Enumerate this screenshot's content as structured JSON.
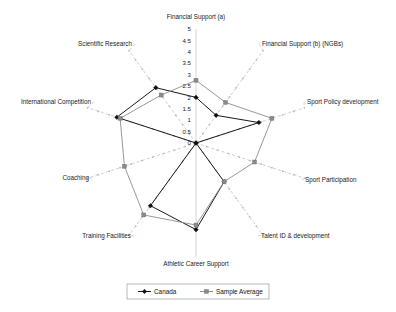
{
  "chart_data": {
    "type": "radar",
    "title": "",
    "categories": [
      "Financial Support (a)",
      "Financial Support (b) (NGBs)",
      "Sport Policy development",
      "Sport Participation",
      "Talent ID & development",
      "Athletic Career Support",
      "Training Facilities",
      "Coaching",
      "International Competition",
      "Scientific Research"
    ],
    "series": [
      {
        "name": "Canada",
        "color": "#1a1a1a",
        "marker": "diamond",
        "values": [
          2.0,
          1.5,
          2.9,
          0.0,
          2.1,
          3.8,
          3.4,
          0.0,
          3.65,
          3.0
        ]
      },
      {
        "name": "Sample Average",
        "color": "#8d8d8d",
        "marker": "square",
        "values": [
          2.75,
          2.2,
          3.5,
          2.7,
          2.1,
          3.6,
          3.9,
          3.3,
          3.5,
          2.6
        ]
      }
    ],
    "tick_labels": [
      "0",
      "0.5",
      "1",
      "1.5",
      "2",
      "2.5",
      "3",
      "3.5",
      "4",
      "4.5",
      "5"
    ],
    "tick_values": [
      0,
      0.5,
      1,
      1.5,
      2,
      2.5,
      3,
      3.5,
      4,
      4.5,
      5
    ],
    "rlim": [
      0,
      5
    ],
    "grid": false,
    "legend_position": "bottom",
    "xlabel": "",
    "ylabel": ""
  },
  "legend": {
    "entries": [
      {
        "label": "Canada"
      },
      {
        "label": "Sample Average"
      }
    ]
  }
}
